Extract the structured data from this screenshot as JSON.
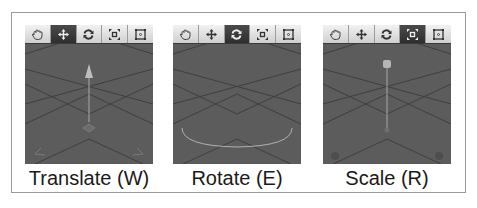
{
  "colors": {
    "viewport_bg": "#5c5c5c",
    "grid_line": "#3f3f3f",
    "gizmo": "#a8a8a8",
    "toolbar_active": "#3a3a3a",
    "toolbar_bg": "#e0e0e0"
  },
  "toolbar_tools": [
    {
      "name": "hand",
      "icon": "hand-icon"
    },
    {
      "name": "move",
      "icon": "move-arrows-icon"
    },
    {
      "name": "rotate",
      "icon": "rotate-arrows-icon"
    },
    {
      "name": "scale",
      "icon": "scale-icon"
    },
    {
      "name": "rect",
      "icon": "rect-transform-icon"
    }
  ],
  "panels": [
    {
      "id": "translate",
      "caption": "Translate (W)",
      "active_tool": 1
    },
    {
      "id": "rotate",
      "caption": "Rotate (E)",
      "active_tool": 2
    },
    {
      "id": "scale",
      "caption": "Scale (R)",
      "active_tool": 3
    }
  ]
}
